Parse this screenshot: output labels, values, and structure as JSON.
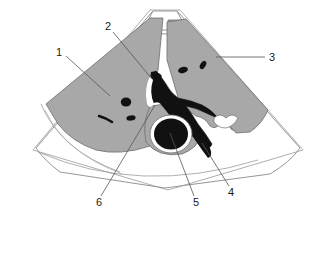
{
  "figure": {
    "modality": "ultrasound-sector-scan",
    "background_color": "#ffffff",
    "parenchyma_color": "#a8a8a8",
    "vessel_color": "#111111",
    "outline_color": "#777777",
    "label_color": "#1a1a1a"
  },
  "labels": [
    {
      "id": "1",
      "text": "1",
      "x": 59,
      "y": 52,
      "anchor_x": 110,
      "anchor_y": 96
    },
    {
      "id": "2",
      "text": "2",
      "x": 108,
      "y": 27,
      "anchor_x": 152,
      "anchor_y": 79
    },
    {
      "id": "3",
      "text": "3",
      "x": 272,
      "y": 58,
      "anchor_x": 218,
      "anchor_y": 60
    },
    {
      "id": "4",
      "text": "4",
      "x": 231,
      "y": 193,
      "anchor_x": 202,
      "anchor_y": 143
    },
    {
      "id": "5",
      "text": "5",
      "x": 196,
      "y": 203,
      "anchor_x": 170,
      "anchor_y": 133
    },
    {
      "id": "6",
      "text": "6",
      "x": 99,
      "y": 203,
      "anchor_x": 155,
      "anchor_y": 105
    }
  ],
  "regions": {
    "left_lobe": "liver-left-lobe",
    "right_lobe": "liver-right-lobe",
    "portal_vein": "portal-vein-confluence",
    "gallbladder": "gallbladder",
    "ivc": "inferior-vena-cava",
    "transducer": "transducer-footprint"
  }
}
